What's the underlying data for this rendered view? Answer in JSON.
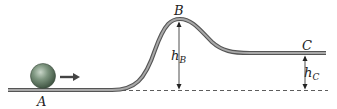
{
  "diagram": {
    "points": {
      "A": {
        "label": "A"
      },
      "B": {
        "label": "B"
      },
      "C": {
        "label": "C"
      }
    },
    "heights": {
      "hB": {
        "main": "h",
        "sub": "B"
      },
      "hC": {
        "main": "h",
        "sub": "C"
      }
    },
    "colors": {
      "track": "#8a8a8a",
      "track_edge": "#555555",
      "ball": "#6e8a72",
      "arrow": "#444444",
      "baseline": "#333333"
    }
  }
}
